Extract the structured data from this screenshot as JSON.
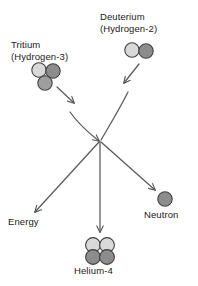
{
  "diagram": {
    "background_color": "#ffffff",
    "stroke_color": "#595959",
    "text_color": "#1a1a1a",
    "proton_color": "#d9d9d9",
    "neutron_color": "#8c8c8c",
    "particle_outline_color": "#404040"
  },
  "reactants": {
    "tritium": {
      "name": "Tritium",
      "alias": "(Hydrogen-3)",
      "nucleon_count": 3,
      "particles": [
        "proton",
        "neutron",
        "neutron"
      ]
    },
    "deuterium": {
      "name": "Deuterium",
      "alias": "(Hydrogen-2)",
      "nucleon_count": 2,
      "particles": [
        "proton",
        "neutron"
      ]
    }
  },
  "products": {
    "energy": {
      "name": "Energy"
    },
    "helium": {
      "name": "Helium-4",
      "nucleon_count": 4,
      "particles": [
        "proton",
        "proton",
        "neutron",
        "neutron"
      ]
    },
    "neutron": {
      "name": "Neutron",
      "nucleon_count": 1,
      "particles": [
        "neutron"
      ]
    }
  },
  "arrows": [
    {
      "name": "tritium-to-core",
      "from": "tritium",
      "to": "fusion-core",
      "style": "curved"
    },
    {
      "name": "deuterium-to-core",
      "from": "deuterium",
      "to": "fusion-core",
      "style": "curved"
    },
    {
      "name": "core-to-energy",
      "from": "fusion-core",
      "to": "energy",
      "style": "straight"
    },
    {
      "name": "core-to-helium",
      "from": "fusion-core",
      "to": "helium",
      "style": "straight"
    },
    {
      "name": "core-to-neutron",
      "from": "fusion-core",
      "to": "neutron",
      "style": "straight"
    }
  ]
}
